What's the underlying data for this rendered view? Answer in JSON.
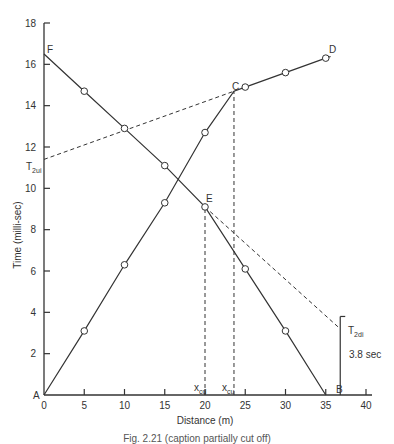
{
  "chart_data": {
    "type": "line",
    "title": "",
    "xlabel": "Distance (m)",
    "ylabel": "Time (milli-sec)",
    "xlim": [
      0,
      40
    ],
    "ylim": [
      0,
      18
    ],
    "x_ticks": [
      0,
      5,
      10,
      15,
      20,
      25,
      30,
      35,
      40
    ],
    "y_ticks": [
      2,
      4,
      6,
      8,
      10,
      12,
      14,
      16,
      18
    ],
    "grid": false,
    "series": [
      {
        "name": "Forward shot A-C-D",
        "style": "solid",
        "markers": true,
        "points": [
          [
            0,
            0
          ],
          [
            5,
            3.1
          ],
          [
            10,
            6.3
          ],
          [
            15,
            9.3
          ],
          [
            20,
            12.7
          ],
          [
            23.6,
            14.7
          ],
          [
            25,
            14.9
          ],
          [
            30,
            15.6
          ],
          [
            35,
            16.3
          ]
        ]
      },
      {
        "name": "Reverse shot F-E-B",
        "style": "solid",
        "markers": true,
        "points": [
          [
            0,
            16.5
          ],
          [
            5,
            14.7
          ],
          [
            10,
            12.9
          ],
          [
            15,
            11.1
          ],
          [
            20,
            9.1
          ],
          [
            25,
            6.1
          ],
          [
            30,
            3.1
          ],
          [
            35,
            0
          ]
        ]
      },
      {
        "name": "Extrapolation C to T2ui",
        "style": "dashed",
        "markers": false,
        "points": [
          [
            0,
            11.4
          ],
          [
            23.6,
            14.7
          ]
        ]
      },
      {
        "name": "Extrapolation E to T2di",
        "style": "dashed",
        "markers": false,
        "points": [
          [
            20,
            9.1
          ],
          [
            36.8,
            3.2
          ]
        ]
      },
      {
        "name": "x_cd crossover line",
        "style": "dashed",
        "markers": false,
        "points": [
          [
            20,
            0
          ],
          [
            20,
            9.1
          ]
        ]
      },
      {
        "name": "x_cu crossover line",
        "style": "dashed",
        "markers": false,
        "points": [
          [
            23.6,
            0
          ],
          [
            23.6,
            14.7
          ]
        ]
      }
    ],
    "annotations": [
      {
        "text": "A",
        "x": 0,
        "y": 0
      },
      {
        "text": "B",
        "x": 35,
        "y": 0
      },
      {
        "text": "C",
        "x": 23.6,
        "y": 14.7
      },
      {
        "text": "D",
        "x": 35,
        "y": 16.3
      },
      {
        "text": "E",
        "x": 20,
        "y": 9.1
      },
      {
        "text": "F",
        "x": 0,
        "y": 16.5
      },
      {
        "text": "T2ui",
        "x": 0,
        "y": 11.4
      },
      {
        "text": "T2di",
        "x": 36.8,
        "y": 3.2
      },
      {
        "text": "x_cd",
        "x": 20,
        "y": 0
      },
      {
        "text": "x_cu",
        "x": 23.6,
        "y": 0
      },
      {
        "text": "3.8 sec",
        "x": 36.8,
        "y": 1.9
      }
    ]
  },
  "labels": {
    "xlabel": "Distance (m)",
    "ylabel": "Time (milli-sec)",
    "x_ticks": [
      "0",
      "5",
      "10",
      "15",
      "20",
      "25",
      "30",
      "35",
      "40"
    ],
    "y_ticks": [
      "2",
      "4",
      "6",
      "8",
      "10",
      "12",
      "14",
      "16",
      "18"
    ],
    "point_A": "A",
    "point_B": "B",
    "point_C": "C",
    "point_D": "D",
    "point_E": "E",
    "point_F": "F",
    "t2ui_main": "T",
    "t2ui_sub": "2ui",
    "t2di_main": "T",
    "t2di_sub": "2di",
    "xcd_main": "x",
    "xcd_sub": "cd",
    "xcu_main": "x",
    "xcu_sub": "cu",
    "bracket_value": "3.8 sec"
  },
  "caption": "Fig. 2.21 (caption partially cut off)"
}
